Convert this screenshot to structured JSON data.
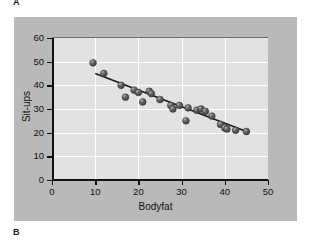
{
  "figure": {
    "panel_a_label": "A",
    "panel_b_label": "B"
  },
  "chart_data": {
    "type": "scatter",
    "title": "",
    "xlabel": "Bodyfat",
    "ylabel": "Sit-ups",
    "xlim": [
      0,
      50
    ],
    "ylim": [
      0,
      60
    ],
    "xticks": [
      0,
      10,
      20,
      30,
      40,
      50
    ],
    "yticks": [
      0,
      10,
      20,
      30,
      40,
      50,
      60
    ],
    "xtick_labels": [
      "0",
      "10",
      "20",
      "30",
      "40",
      "50"
    ],
    "ytick_labels": [
      "0",
      "10",
      "20",
      "30",
      "40",
      "50",
      "60"
    ],
    "grid": true,
    "grid_color": "#ffffff",
    "legend": null,
    "marker_color": "#4f4f4f",
    "marker_highlight": "#d8d8d8",
    "line_color": "#1a1a1a",
    "plot_background": "#e2e2e2",
    "panel_background": "#b9b9b9",
    "points": [
      {
        "x": 9.5,
        "y": 49.5
      },
      {
        "x": 12.0,
        "y": 45.0
      },
      {
        "x": 16.0,
        "y": 40.0
      },
      {
        "x": 17.0,
        "y": 35.0
      },
      {
        "x": 19.0,
        "y": 38.0
      },
      {
        "x": 20.0,
        "y": 37.0
      },
      {
        "x": 21.0,
        "y": 33.0
      },
      {
        "x": 22.5,
        "y": 37.5
      },
      {
        "x": 23.0,
        "y": 36.5
      },
      {
        "x": 25.0,
        "y": 34.0
      },
      {
        "x": 27.5,
        "y": 31.5
      },
      {
        "x": 28.0,
        "y": 30.0
      },
      {
        "x": 29.5,
        "y": 31.5
      },
      {
        "x": 31.0,
        "y": 25.0
      },
      {
        "x": 31.5,
        "y": 30.5
      },
      {
        "x": 33.5,
        "y": 29.5
      },
      {
        "x": 34.5,
        "y": 30.0
      },
      {
        "x": 35.5,
        "y": 29.0
      },
      {
        "x": 37.0,
        "y": 27.0
      },
      {
        "x": 39.0,
        "y": 23.5
      },
      {
        "x": 40.0,
        "y": 22.0
      },
      {
        "x": 40.5,
        "y": 21.5
      },
      {
        "x": 42.5,
        "y": 21.0
      },
      {
        "x": 45.0,
        "y": 20.5
      }
    ],
    "fit_line": {
      "x0": 10.0,
      "y0": 45.0,
      "x1": 45.0,
      "y1": 20.5
    }
  }
}
